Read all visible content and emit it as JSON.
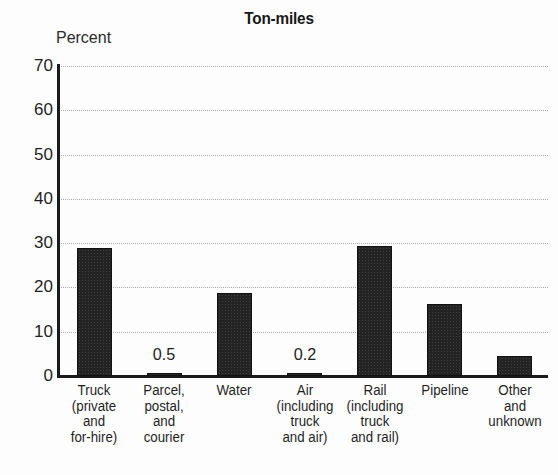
{
  "chart_data": {
    "type": "bar",
    "title": "Ton-miles",
    "xlabel": "",
    "ylabel": "Percent",
    "ylim": [
      0,
      70
    ],
    "ytick_step": 10,
    "yticks": [
      "0",
      "10",
      "20",
      "30",
      "40",
      "50",
      "60",
      "70"
    ],
    "grid": true,
    "legend": null,
    "bar_color": "#232323",
    "categories": [
      "Truck (private and for-hire)",
      "Parcel, postal, and courier",
      "Water",
      "Air (including truck and air)",
      "Rail (including truck and rail)",
      "Pipeline",
      "Other and unknown"
    ],
    "category_lines": [
      [
        "Truck",
        "(private",
        "and",
        "for-hire)"
      ],
      [
        "Parcel,",
        "postal,",
        "and",
        "courier"
      ],
      [
        "Water"
      ],
      [
        "Air",
        "(including",
        "truck",
        "and air)"
      ],
      [
        "Rail",
        "(including",
        "truck",
        "and rail)"
      ],
      [
        "Pipeline"
      ],
      [
        "Other",
        "and",
        "unknown"
      ]
    ],
    "values": [
      29.0,
      0.5,
      18.8,
      0.2,
      29.3,
      16.2,
      4.5
    ],
    "annotations": [
      {
        "category": "Parcel, postal, and courier",
        "text": "0.5"
      },
      {
        "category": "Air (including truck and air)",
        "text": "0.2"
      }
    ]
  }
}
